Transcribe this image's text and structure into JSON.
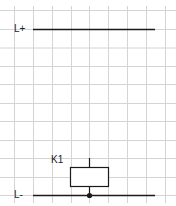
{
  "diagram": {
    "type": "electrical-schematic",
    "grid": {
      "color": "#d4d4d4",
      "x_lines": [
        14,
        33,
        52,
        71,
        89,
        108,
        127,
        146,
        165
      ],
      "y_lines": [
        10,
        29,
        47.5,
        66,
        84,
        103,
        121,
        140,
        158,
        177,
        195
      ],
      "y_start": 6,
      "y_end": 203
    },
    "rails": [
      {
        "label": "L+",
        "y": 29,
        "x1": 33,
        "x2": 155
      },
      {
        "label": "L-",
        "y": 195,
        "x1": 33,
        "x2": 155
      }
    ],
    "components": [
      {
        "id": "K1",
        "label": "K1",
        "symbol": "relay-coil",
        "box": {
          "x": 70,
          "y": 167,
          "w": 38,
          "h": 19
        },
        "terminal_x": 89,
        "terminal_top_y": 158,
        "connected_to": "L-"
      }
    ],
    "junctions": [
      {
        "x": 89,
        "y": 195
      }
    ],
    "line_color": "#1a1a1a"
  }
}
